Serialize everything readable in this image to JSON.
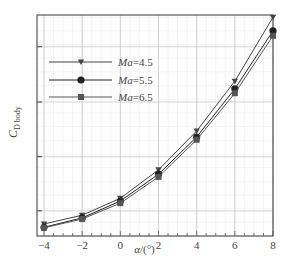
{
  "chart_data": {
    "type": "line",
    "title": "",
    "xlabel": "α/(°)",
    "ylabel": "C_D_body",
    "ylabel_main": "C",
    "ylabel_sub": "D body",
    "x": [
      -4,
      -2,
      0,
      2,
      4,
      6,
      8
    ],
    "x_ticks": [
      "−4",
      "−2",
      "0",
      "2",
      "4",
      "6",
      "8"
    ],
    "xlim": [
      -4.6,
      8
    ],
    "ylim": [
      0,
      4.04
    ],
    "y_ticks_labeled": false,
    "y_units": "relative (no tick labels shown; 1 unit = 1 major grid spacing)",
    "grid": true,
    "legend_position": "upper left",
    "series": [
      {
        "name": "Ma=4.5",
        "marker": "triangle-down",
        "color": "#444444",
        "values": [
          0.22,
          0.38,
          0.69,
          1.21,
          1.92,
          2.83,
          4.0
        ]
      },
      {
        "name": "Ma=5.5",
        "marker": "circle",
        "color": "#222222",
        "values": [
          0.16,
          0.33,
          0.64,
          1.13,
          1.81,
          2.69,
          3.75
        ]
      },
      {
        "name": "Ma=6.5",
        "marker": "square",
        "color": "#555555",
        "values": [
          0.15,
          0.31,
          0.6,
          1.08,
          1.76,
          2.61,
          3.66
        ]
      }
    ]
  },
  "legend": {
    "items": [
      {
        "prefix": "Ma",
        "suffix": "=4.5"
      },
      {
        "prefix": "Ma",
        "suffix": "=5.5"
      },
      {
        "prefix": "Ma",
        "suffix": "=6.5"
      }
    ]
  },
  "axes": {
    "xlabel_alpha": "α",
    "xlabel_unit": "/(°)"
  }
}
